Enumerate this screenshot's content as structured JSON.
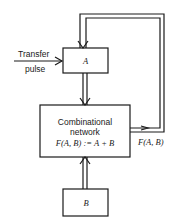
{
  "diagram": {
    "input_label_line1": "Transfer",
    "input_label_line2": "pulse",
    "register_a": "A",
    "register_b": "B",
    "network_line1": "Combinational",
    "network_line2": "network",
    "network_line3": "F(A, B) := A + B",
    "output_label": "F(A, B)",
    "stroke_color": "#1a1a1a"
  }
}
